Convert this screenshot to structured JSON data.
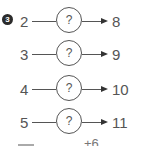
{
  "question": {
    "number": "3",
    "rows": [
      {
        "input": "2",
        "operator": "?",
        "output": "8"
      },
      {
        "input": "3",
        "operator": "?",
        "output": "9"
      },
      {
        "input": "4",
        "operator": "?",
        "output": "10"
      },
      {
        "input": "5",
        "operator": "?",
        "output": "11"
      }
    ],
    "answer_hint": "+6"
  }
}
